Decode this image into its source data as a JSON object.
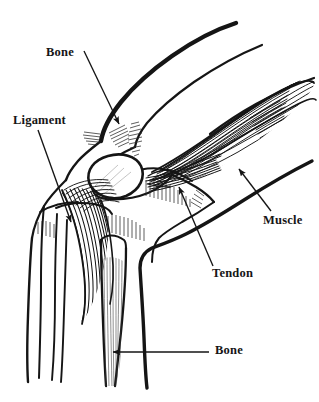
{
  "figure": {
    "background_color": "#ffffff",
    "ink_color": "#151515",
    "labels": [
      {
        "id": "bone-top",
        "text": "Bone",
        "target": "femur",
        "leader": "diagonal-arrow-down-right"
      },
      {
        "id": "ligament",
        "text": "Ligament",
        "target": "patellar-ligament",
        "leader": "diagonal-arrow-down-right"
      },
      {
        "id": "muscle",
        "text": "Muscle",
        "target": "muscle-belly",
        "leader": "diagonal-arrow-up-left"
      },
      {
        "id": "tendon",
        "text": "Tendon",
        "target": "tendon-insertion",
        "leader": "diagonal-arrow-up-left"
      },
      {
        "id": "bone-bottom",
        "text": "Bone",
        "target": "tibia",
        "leader": "horizontal-arrow-left"
      }
    ]
  }
}
